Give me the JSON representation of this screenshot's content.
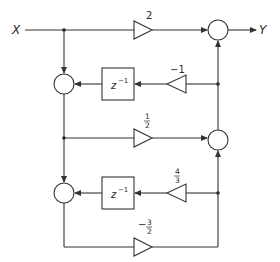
{
  "diagram": {
    "type": "signal-flow block diagram",
    "input": {
      "label": "X"
    },
    "output": {
      "label": "Y"
    },
    "gains": {
      "forward_top": {
        "label": "2"
      },
      "feedback_1": {
        "label": "−1"
      },
      "forward_mid": {
        "num": "1",
        "den": "2"
      },
      "feedback_2": {
        "num": "4",
        "den": "3"
      },
      "forward_bottom": {
        "sign": "−",
        "num": "3",
        "den": "2"
      }
    },
    "delays": [
      {
        "base": "z",
        "exp": "−1"
      },
      {
        "base": "z",
        "exp": "−1"
      }
    ],
    "summers": [
      "left-summer-1",
      "left-summer-2",
      "right-summer-top",
      "right-summer-middle"
    ],
    "colors": {
      "line": "#333333",
      "background": "#ffffff"
    }
  }
}
